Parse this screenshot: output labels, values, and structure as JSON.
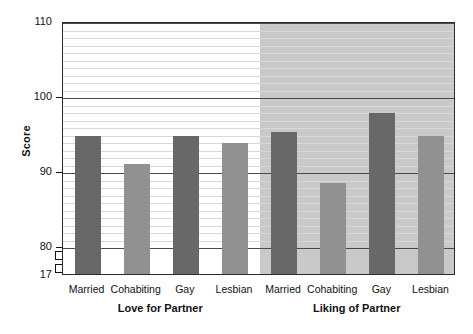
{
  "chart_data": {
    "type": "bar",
    "title": "",
    "xlabel": "",
    "ylabel": "Score",
    "ylim": [
      17,
      110
    ],
    "y_ticks": [
      17,
      80,
      90,
      100,
      110
    ],
    "y_tick_labels": [
      "17",
      "80",
      "90",
      "100",
      "110"
    ],
    "axis_break": true,
    "axis_break_between": [
      17,
      80
    ],
    "grid": true,
    "grid_minor_step": 1,
    "grid_major_step": 10,
    "legend": "none",
    "categories": [
      "Married",
      "Cohabiting",
      "Gay",
      "Lesbian"
    ],
    "groups": [
      {
        "name": "Love for Partner",
        "shaded": false,
        "values": [
          95.0,
          91.2,
          95.0,
          94.0
        ],
        "bar_colors": [
          "dark",
          "light",
          "dark",
          "light"
        ]
      },
      {
        "name": "Liking of Partner",
        "shaded": true,
        "values": [
          95.5,
          88.7,
          98.0,
          95.0
        ],
        "bar_colors": [
          "dark",
          "light",
          "dark",
          "light"
        ]
      }
    ],
    "colors": {
      "bar_dark": "#686868",
      "bar_light": "#919191",
      "shaded_panel": "#c9c9c9",
      "gridline_minor": "#d8d8d8",
      "gridline_major": "#4a4a4a",
      "frame": "#2b2b2b",
      "text": "#111111"
    }
  }
}
